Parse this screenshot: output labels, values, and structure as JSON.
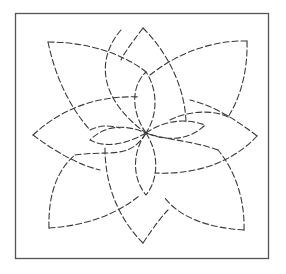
{
  "diagram": {
    "type": "line-drawing",
    "frame": {
      "shape": "square",
      "stroke_color": "#555555"
    },
    "line_style": "dashed",
    "line_color": "#3a3a3a",
    "center": [
      146,
      133
    ],
    "petals": [
      {
        "name": "large-petal-top-left",
        "tip": [
          48,
          42
        ]
      },
      {
        "name": "large-petal-top-right",
        "tip": [
          247,
          41
        ]
      },
      {
        "name": "large-petal-bottom-left",
        "tip": [
          49,
          228
        ]
      },
      {
        "name": "large-petal-bottom-right",
        "tip": [
          244,
          230
        ]
      },
      {
        "name": "small-petal-top",
        "tip": [
          143,
          28
        ]
      },
      {
        "name": "small-petal-left",
        "tip": [
          33,
          135
        ]
      },
      {
        "name": "small-petal-right",
        "tip": [
          257,
          136
        ]
      },
      {
        "name": "small-petal-bottom",
        "tip": [
          143,
          243
        ]
      }
    ]
  }
}
